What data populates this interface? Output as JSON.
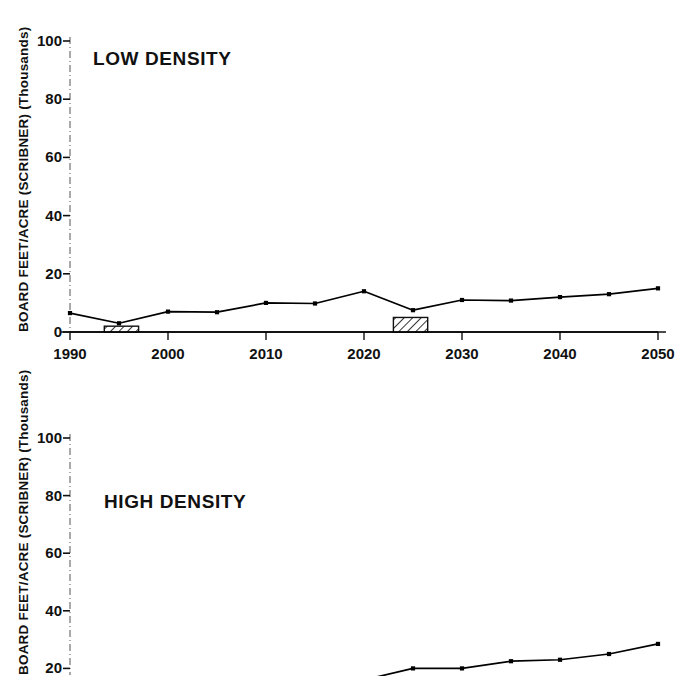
{
  "figure": {
    "y_axis_label": "BOARD FEET/ACRE (SCRIBNER) (Thousands)",
    "y_axis_label_partial": "BOARD FEET/ACRE (SCRIBNER) (Thousands)"
  },
  "chart_data": [
    {
      "type": "line",
      "title": "LOW DENSITY",
      "xlabel": "",
      "ylabel": "BOARD FEET/ACRE (SCRIBNER) (Thousands)",
      "xlim": [
        1990,
        2050
      ],
      "ylim": [
        0,
        100
      ],
      "grid": false,
      "legend": "none",
      "xticks": [
        "1990",
        "2000",
        "2010",
        "2020",
        "2030",
        "2040",
        "2050"
      ],
      "xtick_values": [
        1990,
        2000,
        2010,
        2020,
        2030,
        2040,
        2050
      ],
      "yticks": [
        "0",
        "20",
        "40",
        "60",
        "80",
        "100"
      ],
      "ytick_values": [
        0,
        20,
        40,
        60,
        80,
        100
      ],
      "series": [
        {
          "name": "board feet per acre",
          "x": [
            1990,
            1995,
            2000,
            2005,
            2010,
            2015,
            2020,
            2025,
            2030,
            2035,
            2040,
            2045,
            2050
          ],
          "values": [
            6.5,
            3.0,
            7.0,
            6.8,
            10.0,
            9.8,
            14.0,
            7.5,
            11.0,
            10.8,
            12.0,
            13.0,
            15.0
          ],
          "marker": "square",
          "color": "#000000"
        },
        {
          "name": "baseline",
          "x": [
            1990,
            2050
          ],
          "values": [
            0,
            0
          ],
          "marker": "none",
          "color": "#000000"
        }
      ],
      "annotations": [
        {
          "kind": "hatched-box",
          "x_start": 1993.5,
          "x_end": 1997.0,
          "y_start": 0,
          "y_end": 2.0
        },
        {
          "kind": "hatched-box",
          "x_start": 2023.0,
          "x_end": 2026.5,
          "y_start": 0,
          "y_end": 5.0
        }
      ]
    },
    {
      "type": "line",
      "title": "HIGH DENSITY",
      "xlabel": "",
      "ylabel": "BOARD FEET/ACRE (SCRIBNER) (Thousands)",
      "xlim": [
        1990,
        2050
      ],
      "ylim": [
        0,
        100
      ],
      "grid": false,
      "legend": "none",
      "note": "panel cropped at bottom of image",
      "xticks": [],
      "yticks": [
        "20",
        "40",
        "60",
        "80",
        "100"
      ],
      "ytick_values": [
        20,
        40,
        60,
        80,
        100
      ],
      "series": [
        {
          "name": "board feet per acre",
          "x": [
            2015,
            2020,
            2025,
            2030,
            2035,
            2040,
            2045,
            2050
          ],
          "values": [
            12.5,
            16.0,
            20.0,
            20.0,
            22.5,
            23.0,
            25.0,
            28.5
          ],
          "marker": "square",
          "color": "#000000"
        }
      ],
      "annotations": []
    }
  ]
}
